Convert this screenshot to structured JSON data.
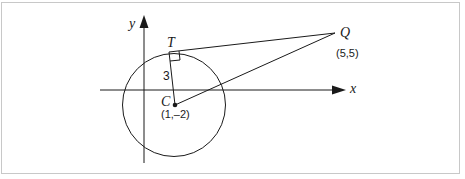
{
  "diagram": {
    "axes": {
      "x_label": "x",
      "y_label": "y"
    },
    "points": {
      "T": {
        "label": "T"
      },
      "Q": {
        "label": "Q",
        "coords": "(5,5)"
      },
      "C": {
        "label": "C",
        "coords": "(1,–2)"
      }
    },
    "radius_label": "3",
    "colors": {
      "stroke": "#1a1a1a",
      "frame": "#c8c8c8",
      "background": "#ffffff"
    }
  }
}
